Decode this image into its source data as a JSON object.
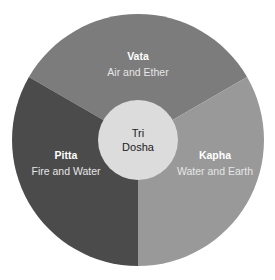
{
  "diagram": {
    "center": {
      "line1": "Tri",
      "line2": "Dosha",
      "color": "#dcdcdc"
    },
    "segments": [
      {
        "name": "Vata",
        "elements": "Air and Ether",
        "color": "#7c7c7c"
      },
      {
        "name": "Pitta",
        "elements": "Fire and Water",
        "color": "#4b4b4b"
      },
      {
        "name": "Kapha",
        "elements": "Water and Earth",
        "color": "#999999"
      }
    ]
  }
}
